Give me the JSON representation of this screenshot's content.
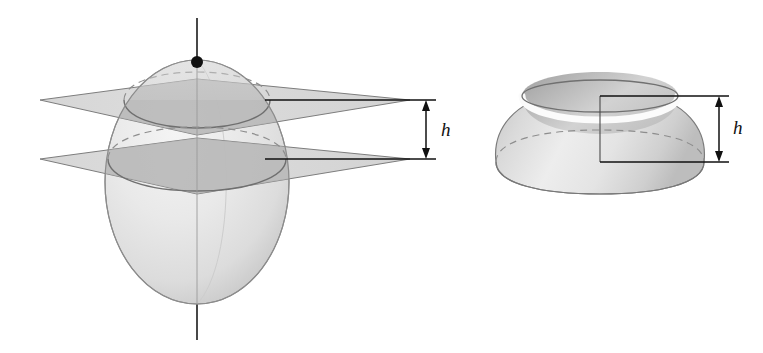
{
  "figure": {
    "background_color": "#ffffff",
    "ink_color": "#1a1a1a",
    "palette": {
      "sphere_fill_light": "#ededed",
      "sphere_fill_mid": "#dcdcdc",
      "sphere_fill_shadow": "#c4c4c4",
      "plane_fill": "#d0d0d0",
      "plane_fill_overlap": "#b9b9b9",
      "zone_fill_light": "#e6e6e6",
      "zone_fill_shadow": "#c0c0c0",
      "outline": "#6e6e6e",
      "dashed_line": "#8a8a8a",
      "dimension_line": "#111111"
    },
    "panels": [
      {
        "name": "sphere-with-cutting-planes",
        "elements": [
          "vertical-axis",
          "north-pole-point",
          "sphere",
          "upper-cutting-plane",
          "lower-cutting-plane",
          "upper-circle-of-intersection",
          "lower-circle-of-intersection",
          "height-dimension"
        ]
      },
      {
        "name": "spherical-zone",
        "elements": [
          "zone-body",
          "zone-top-opening",
          "zone-bottom-ellipse",
          "interior-axis-segment",
          "leader-line",
          "height-dimension"
        ]
      }
    ]
  },
  "labels": {
    "height_left": "h",
    "height_right": "h"
  },
  "geometry": {
    "sphere": {
      "center_x": 197,
      "center_y": 182,
      "radius_x": 92,
      "radius_y": 122,
      "top_y": 60,
      "bottom_y": 304
    },
    "axis": {
      "x": 197,
      "top_y": 18,
      "bottom_y": 340
    },
    "north_pole_dot": {
      "cx": 197,
      "cy": 62,
      "r": 6
    },
    "upper_plane": {
      "cut_y": 100,
      "left_tip_x": 40,
      "right_tip_x": 410,
      "near_vertex_y": 135
    },
    "lower_plane": {
      "cut_y": 159,
      "left_tip_x": 40,
      "right_tip_x": 410,
      "near_vertex_y": 194
    },
    "height_dimension_left": {
      "x": 426,
      "top_y": 100,
      "bottom_y": 159,
      "label_x": 441,
      "label_y": 134
    },
    "zone": {
      "center_x": 600,
      "top_ellipse_cy": 96,
      "top_ellipse_rx": 78,
      "top_ellipse_ry": 16,
      "bottom_ellipse_cy": 162,
      "bottom_ellipse_rx": 104,
      "bottom_ellipse_ry": 22,
      "left_x": 496,
      "right_x": 704
    },
    "height_dimension_right": {
      "x": 719,
      "top_y": 96,
      "bottom_y": 162,
      "label_x": 733,
      "label_y": 132
    },
    "leader_line": {
      "corner_x": 600,
      "top_y": 96,
      "right_x": 719
    }
  }
}
